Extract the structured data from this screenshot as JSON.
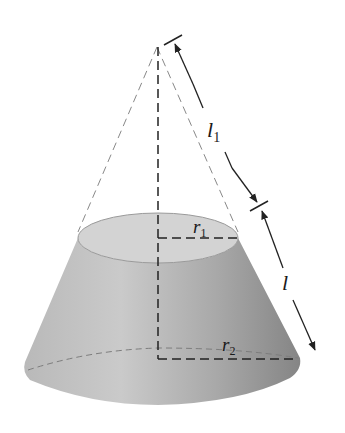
{
  "figure": {
    "labels": {
      "l1": {
        "main": "l",
        "sub": "1"
      },
      "l": {
        "main": "l"
      },
      "r1": {
        "main": "r",
        "sub": "1"
      },
      "r2": {
        "main": "r",
        "sub": "2"
      }
    },
    "colors": {
      "frustum_side_light": "#c4c4c4",
      "frustum_side_dark": "#8e8e8e",
      "top_face": "#cfcfcf",
      "line": "#222222",
      "dashed_light": "#8a8a8a",
      "background": "#ffffff"
    }
  }
}
